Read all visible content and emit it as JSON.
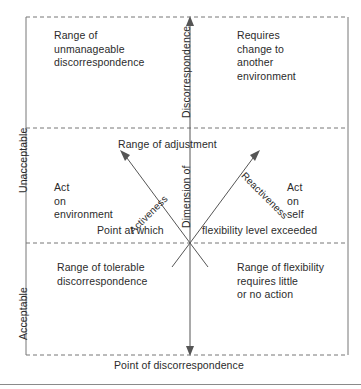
{
  "figure": {
    "caption_bottom": "Point of discorrespondence",
    "axis": {
      "vertical_label_top": "Discorrespondence",
      "vertical_label_bottom": "Dimension of",
      "left_label_upper": "Unacceptable",
      "left_label_lower": "Acceptable"
    },
    "diagonals": {
      "left_label": "Activeness",
      "right_label": "Reactiveness"
    },
    "bands": {
      "range_of_adjustment": "Range of adjustment",
      "point_at_which": "Point at which",
      "flexibility_level_exceeded": "flexibility level exceeded"
    },
    "quadrants": {
      "upper_left": "Range of\nunmanageable\ndiscorrespondence",
      "upper_right": "Requires\nchange to\nanother\nenvironment",
      "middle_left": "Act\non\nenvironment",
      "middle_right": "Act\non\nself",
      "lower_left": "Range of tolerable\ndiscorrespondence",
      "lower_right": "Range of flexibility\nrequires little\nor no action"
    },
    "colors": {
      "text": "#2b2b2b",
      "line": "#555555",
      "frame": "#777777",
      "background": "#ffffff"
    }
  }
}
